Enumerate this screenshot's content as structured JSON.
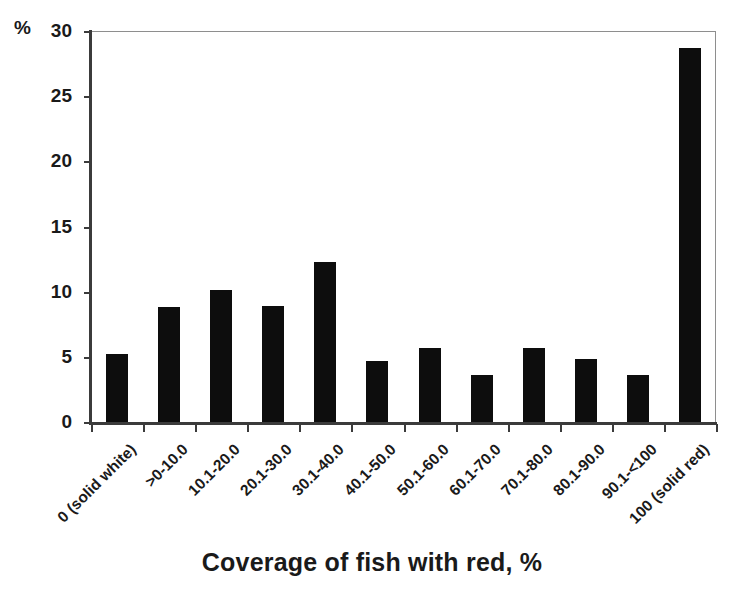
{
  "chart_data": {
    "type": "bar",
    "title": "",
    "xlabel": "Coverage of fish with red, %",
    "ylabel": "%",
    "ylim": [
      0,
      30
    ],
    "yticks": [
      0,
      5,
      10,
      15,
      20,
      25,
      30
    ],
    "ytick_labels": [
      "0",
      "5",
      "10",
      "15",
      "20",
      "25",
      "30"
    ],
    "grid": false,
    "legend": "none",
    "bar_color": "#0d0d0d",
    "axis_color": "#3b3b3b",
    "categories": [
      "0 (solid white)",
      ">0-10.0",
      "10.1-20.0",
      "20.1-30.0",
      "30.1-40.0",
      "40.1-50.0",
      "50.1-60.0",
      "60.1-70.0",
      "70.1-80.0",
      "80.1-90.0",
      "90.1-<100",
      "100 (solid red)"
    ],
    "values": [
      5.2,
      8.8,
      10.1,
      8.9,
      12.3,
      4.7,
      5.7,
      3.6,
      5.7,
      4.8,
      3.6,
      28.7
    ]
  },
  "axes": {
    "y_unit": "%",
    "x_title": "Coverage of fish with red, %"
  }
}
